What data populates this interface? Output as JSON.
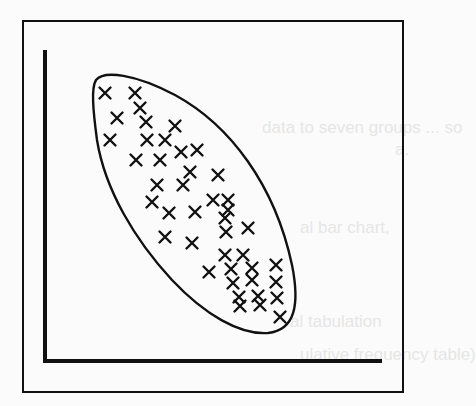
{
  "chart_data": {
    "type": "scatter",
    "title": "",
    "xlabel": "",
    "ylabel": "",
    "grid": false,
    "legend": null,
    "marker": "x",
    "annotation": "ellipse enclosing all points (negative correlation)",
    "points_pixel": [
      [
        105,
        93
      ],
      [
        135,
        93
      ],
      [
        140,
        108
      ],
      [
        117,
        118
      ],
      [
        146,
        122
      ],
      [
        110,
        140
      ],
      [
        147,
        140
      ],
      [
        165,
        140
      ],
      [
        175,
        126
      ],
      [
        197,
        150
      ],
      [
        136,
        160
      ],
      [
        160,
        160
      ],
      [
        181,
        152
      ],
      [
        190,
        172
      ],
      [
        218,
        175
      ],
      [
        157,
        185
      ],
      [
        183,
        185
      ],
      [
        152,
        202
      ],
      [
        169,
        213
      ],
      [
        195,
        212
      ],
      [
        213,
        200
      ],
      [
        228,
        200
      ],
      [
        228,
        210
      ],
      [
        225,
        218
      ],
      [
        165,
        237
      ],
      [
        192,
        243
      ],
      [
        226,
        232
      ],
      [
        248,
        228
      ],
      [
        225,
        255
      ],
      [
        243,
        255
      ],
      [
        276,
        265
      ],
      [
        209,
        272
      ],
      [
        231,
        269
      ],
      [
        252,
        268
      ],
      [
        233,
        283
      ],
      [
        252,
        280
      ],
      [
        276,
        282
      ],
      [
        239,
        297
      ],
      [
        258,
        296
      ],
      [
        277,
        298
      ],
      [
        280,
        317
      ],
      [
        260,
        305
      ],
      [
        240,
        306
      ]
    ],
    "ellipse": {
      "cx": 190,
      "cy": 200,
      "rx": 72,
      "ry": 142,
      "rotation_deg": -38
    },
    "frame": {
      "x": 23,
      "y": 21,
      "w": 380,
      "h": 371
    },
    "axes": {
      "origin": [
        45,
        361
      ],
      "y_top": 50,
      "x_right": 382
    }
  },
  "background_bleed_text": [
    "data to seven groups ... so",
    "a.",
    "al bar chart,",
    "al tabulation",
    "ulative frequency table)"
  ]
}
